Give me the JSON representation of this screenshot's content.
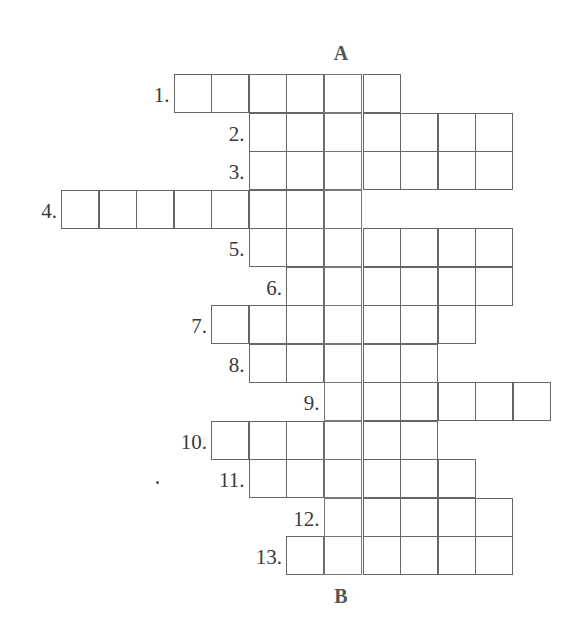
{
  "puzzle": {
    "top_label": "A",
    "bottom_label": "B",
    "key_column": 7,
    "rows": [
      {
        "number": "1.",
        "start": 3,
        "end": 8
      },
      {
        "number": "2.",
        "start": 5,
        "end": 11
      },
      {
        "number": "3.",
        "start": 5,
        "end": 11
      },
      {
        "number": "4.",
        "start": 0,
        "end": 7
      },
      {
        "number": "5.",
        "start": 5,
        "end": 11
      },
      {
        "number": "6.",
        "start": 6,
        "end": 11
      },
      {
        "number": "7.",
        "start": 4,
        "end": 10
      },
      {
        "number": "8.",
        "start": 5,
        "end": 9
      },
      {
        "number": "9.",
        "start": 7,
        "end": 12
      },
      {
        "number": "10.",
        "start": 4,
        "end": 9
      },
      {
        "number": "11.",
        "start": 5,
        "end": 10
      },
      {
        "number": "12.",
        "start": 7,
        "end": 11
      },
      {
        "number": "13.",
        "start": 6,
        "end": 11
      }
    ]
  }
}
